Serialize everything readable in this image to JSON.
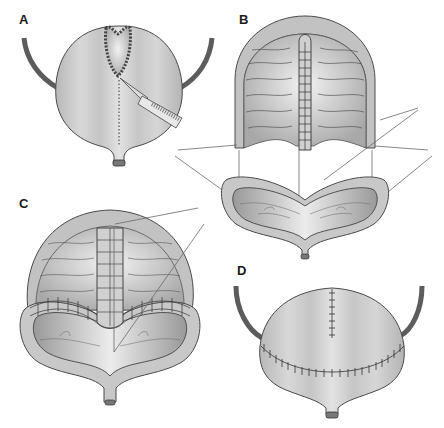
{
  "figure": {
    "type": "surgical-illustration",
    "panels": [
      {
        "id": "A",
        "label": "A",
        "description": "intact bladder with ureters, dome opened, scalpel incising along dotted line toward bladder neck"
      },
      {
        "id": "B",
        "label": "B",
        "description": "bladder bivalved: anterior flap with mucosal folds and midline strip; lower cup showing cut wall; guide lines connecting the halves"
      },
      {
        "id": "C",
        "label": "C",
        "description": "halves approximated with interrupted sutures along rim; midline strip seated; guide lines"
      },
      {
        "id": "D",
        "label": "D",
        "description": "closed bladder with vertical suture line on dome and transverse curved suture line; ureters attached"
      }
    ]
  },
  "colors": {
    "bladder_fill": "#c9c9c9",
    "bladder_light": "#e6e6e6",
    "outline": "#4a4a4a",
    "ureter": "#5c5c5c",
    "guide_line": "#6a6a6a",
    "background": "#ffffff"
  }
}
